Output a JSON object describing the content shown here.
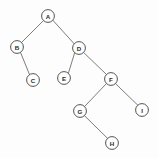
{
  "diagram": {
    "kind": "binary-tree",
    "canvas": {
      "width": 158,
      "height": 158,
      "background": "#fdfdfd"
    },
    "style": {
      "node_radius": 6.4,
      "node_fill": "#fefefe",
      "node_stroke": "#4a4a4a",
      "edge_stroke": "#6e6e6e",
      "label_color": "#2b2b2b"
    },
    "nodes": [
      {
        "id": "A",
        "label": "A",
        "cx": 48,
        "cy": 16,
        "r": 6.4
      },
      {
        "id": "B",
        "label": "B",
        "cx": 17,
        "cy": 47,
        "r": 6.4
      },
      {
        "id": "C",
        "label": "C",
        "cx": 33,
        "cy": 80,
        "r": 6.4
      },
      {
        "id": "D",
        "label": "D",
        "cx": 79,
        "cy": 48,
        "r": 6.4
      },
      {
        "id": "E",
        "label": "E",
        "cx": 64,
        "cy": 78,
        "r": 6.4
      },
      {
        "id": "F",
        "label": "F",
        "cx": 111,
        "cy": 79,
        "r": 6.4
      },
      {
        "id": "G",
        "label": "G",
        "cx": 80,
        "cy": 111,
        "r": 6.4
      },
      {
        "id": "H",
        "label": "H",
        "cx": 112,
        "cy": 143,
        "r": 6.4
      },
      {
        "id": "I",
        "label": "I",
        "cx": 142,
        "cy": 110,
        "r": 6.4
      }
    ],
    "edges": [
      {
        "from": "A",
        "to": "B",
        "side": "left",
        "x1": 43.5,
        "y1": 20.6,
        "x2": 21.5,
        "y2": 42.5
      },
      {
        "from": "A",
        "to": "D",
        "side": "right",
        "x1": 52.8,
        "y1": 20.2,
        "x2": 74.3,
        "y2": 43.9
      },
      {
        "from": "B",
        "to": "C",
        "side": "right",
        "x1": 20.6,
        "y1": 52.6,
        "x2": 29.5,
        "y2": 74.5
      },
      {
        "from": "D",
        "to": "E",
        "side": "left",
        "x1": 74.7,
        "y1": 52.6,
        "x2": 68.4,
        "y2": 73.2
      },
      {
        "from": "D",
        "to": "F",
        "side": "right",
        "x1": 83.7,
        "y1": 52.6,
        "x2": 106.5,
        "y2": 74.5
      },
      {
        "from": "F",
        "to": "G",
        "side": "left",
        "x1": 106.5,
        "y1": 83.5,
        "x2": 84.6,
        "y2": 106.5
      },
      {
        "from": "F",
        "to": "I",
        "side": "right",
        "x1": 115.3,
        "y1": 83.4,
        "x2": 137.9,
        "y2": 105.3
      },
      {
        "from": "G",
        "to": "H",
        "side": "right",
        "x1": 84.3,
        "y1": 115.5,
        "x2": 107.8,
        "y2": 138.6
      }
    ]
  }
}
